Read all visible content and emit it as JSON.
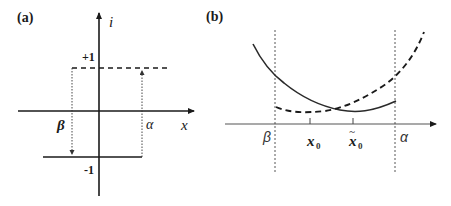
{
  "figure": {
    "panel_a": {
      "label": "(a)",
      "y_axis_label": "i",
      "x_axis_label": "x",
      "plus_one_label": "+1",
      "minus_one_label": "-1",
      "beta_label": "β",
      "alpha_label": "α",
      "description": "Hysteresis relay: output switches from -1 to +1 at x = α and from +1 to -1 at x = β"
    },
    "panel_b": {
      "label": "(b)",
      "beta_label": "β",
      "alpha_label": "α",
      "x0_label": "x",
      "x0_subscript": "0",
      "x0_tilde_label": "x̃",
      "x0_tilde_subscript": "0",
      "tilde": "~",
      "curves": [
        {
          "name": "solid-curve",
          "style": "solid"
        },
        {
          "name": "dashed-curve",
          "style": "dashed"
        }
      ]
    },
    "colors": {
      "line": "#1a1a1a",
      "text": "#1a1a1a",
      "background": "#ffffff"
    }
  }
}
